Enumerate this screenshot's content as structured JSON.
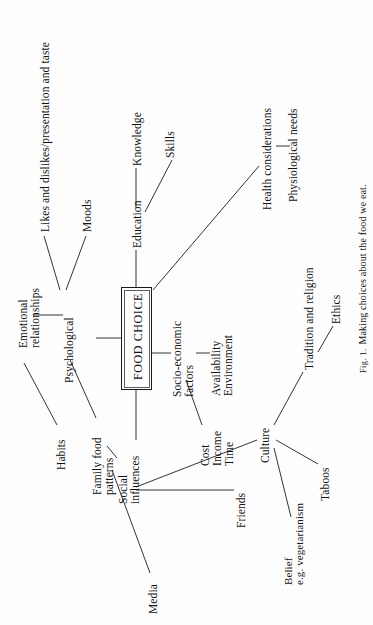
{
  "figure": {
    "center": {
      "label": "FOOD CHOICE"
    },
    "caption": {
      "prefix": "Fig. 1.",
      "text": "Making choices about the food we eat.",
      "full": "Fig. 1.  Making choices about the food we eat."
    },
    "orientation": "rotated-90-ccw",
    "ink_color": "#1d1d1d",
    "background_color": "#ffffff",
    "nodes": [
      {
        "id": "psychological",
        "label": "Psychological"
      },
      {
        "id": "likes-dislikes",
        "label": "Likes and dislikes/presentation and taste"
      },
      {
        "id": "moods",
        "label": "Moods"
      },
      {
        "id": "emotional",
        "label": "Emotional\nrelationships"
      },
      {
        "id": "habits",
        "label": "Habits"
      },
      {
        "id": "education",
        "label": "Education"
      },
      {
        "id": "knowledge",
        "label": "Knowledge"
      },
      {
        "id": "skills",
        "label": "Skills"
      },
      {
        "id": "health",
        "label": "Health considerations"
      },
      {
        "id": "physiological",
        "label": "Physiological needs"
      },
      {
        "id": "socio-economic",
        "label": "Socio-economic\nfactors"
      },
      {
        "id": "cost-income-time",
        "label": "Cost\nIncome\nTime"
      },
      {
        "id": "avail-env",
        "label": "Availability\nEnvironment"
      },
      {
        "id": "social",
        "label": "Social\ninfluences"
      },
      {
        "id": "family",
        "label": "Family food\npatterns"
      },
      {
        "id": "media",
        "label": "Media"
      },
      {
        "id": "friends",
        "label": "Friends"
      },
      {
        "id": "culture",
        "label": "Culture"
      },
      {
        "id": "tradition",
        "label": "Tradition and religion"
      },
      {
        "id": "ethics",
        "label": "Ethics"
      },
      {
        "id": "taboos",
        "label": "Taboos"
      },
      {
        "id": "belief",
        "label": "Belief\ne.g. vegetarianism"
      }
    ],
    "edges": [
      {
        "from": "food-choice",
        "to": "psychological"
      },
      {
        "from": "food-choice",
        "to": "education"
      },
      {
        "from": "food-choice",
        "to": "health"
      },
      {
        "from": "food-choice",
        "to": "socio-economic"
      },
      {
        "from": "food-choice",
        "to": "social"
      },
      {
        "from": "psychological",
        "to": "likes-dislikes"
      },
      {
        "from": "psychological",
        "to": "moods"
      },
      {
        "from": "psychological",
        "to": "emotional"
      },
      {
        "from": "psychological",
        "to": "family"
      },
      {
        "from": "emotional",
        "to": "habits"
      },
      {
        "from": "education",
        "to": "knowledge"
      },
      {
        "from": "education",
        "to": "skills"
      },
      {
        "from": "health",
        "to": "physiological"
      },
      {
        "from": "socio-economic",
        "to": "cost-income-time"
      },
      {
        "from": "socio-economic",
        "to": "avail-env"
      },
      {
        "from": "social",
        "to": "family"
      },
      {
        "from": "social",
        "to": "media"
      },
      {
        "from": "social",
        "to": "friends"
      },
      {
        "from": "social",
        "to": "culture"
      },
      {
        "from": "culture",
        "to": "tradition"
      },
      {
        "from": "culture",
        "to": "taboos"
      },
      {
        "from": "culture",
        "to": "belief"
      },
      {
        "from": "tradition",
        "to": "ethics"
      }
    ]
  }
}
